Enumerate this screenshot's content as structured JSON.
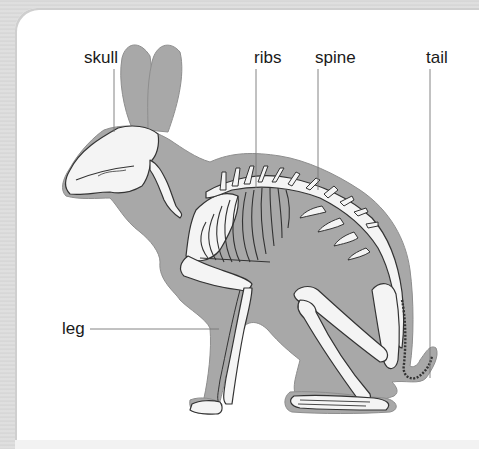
{
  "diagram": {
    "labels": [
      {
        "id": "skull",
        "text": "skull"
      },
      {
        "id": "ribs",
        "text": "ribs"
      },
      {
        "id": "spine",
        "text": "spine"
      },
      {
        "id": "tail",
        "text": "tail"
      },
      {
        "id": "leg",
        "text": "leg"
      }
    ],
    "colors": {
      "body_silhouette": "#a8a8a8",
      "bone_fill": "#f4f4f4",
      "bone_outline": "#333333",
      "leader_line": "#777777",
      "frame": "#d9d9d9",
      "panel": "#ffffff"
    }
  }
}
